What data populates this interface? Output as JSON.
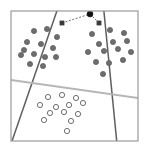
{
  "figure": {
    "title": "",
    "caption": "",
    "background_color": "#ffffff",
    "frame": {
      "name": "plot-frame",
      "x": 11,
      "y": 11,
      "width": 127,
      "height": 130,
      "stroke_color": "#9a9a9a",
      "stroke_width": 1.2
    }
  },
  "chart_data": {
    "type": "scatter",
    "title": "",
    "xlabel": "",
    "ylabel": "",
    "xlim": [
      11,
      138
    ],
    "ylim": [
      11,
      141
    ],
    "grid": false,
    "legend": null,
    "axes_visible": false,
    "series": [
      {
        "name": "class-a-upper-left",
        "marker": "filled-circle",
        "color": "#5a5a5a",
        "fill": "#6e6e6e",
        "radius": 2.6,
        "count": 13,
        "points": [
          [
            34,
            31
          ],
          [
            47,
            29
          ],
          [
            57,
            37
          ],
          [
            27,
            42
          ],
          [
            41,
            44
          ],
          [
            53,
            48
          ],
          [
            21,
            55
          ],
          [
            34,
            54
          ],
          [
            45,
            57
          ],
          [
            30,
            64
          ],
          [
            43,
            66
          ],
          [
            56,
            57
          ],
          [
            24,
            50
          ]
        ]
      },
      {
        "name": "class-a-upper-right",
        "marker": "filled-circle",
        "color": "#5a5a5a",
        "fill": "#6e6e6e",
        "radius": 2.6,
        "count": 14,
        "points": [
          [
            92,
            34
          ],
          [
            110,
            30
          ],
          [
            124,
            33
          ],
          [
            99,
            44
          ],
          [
            113,
            42
          ],
          [
            127,
            41
          ],
          [
            88,
            52
          ],
          [
            104,
            51
          ],
          [
            118,
            49
          ],
          [
            96,
            62
          ],
          [
            109,
            63
          ],
          [
            123,
            60
          ],
          [
            131,
            52
          ],
          [
            103,
            74
          ]
        ]
      },
      {
        "name": "class-b-lower",
        "marker": "hollow-circle",
        "color": "#6e6e6e",
        "fill": "none",
        "radius": 2.6,
        "count": 13,
        "points": [
          [
            48,
            97
          ],
          [
            62,
            95
          ],
          [
            76,
            98
          ],
          [
            40,
            105
          ],
          [
            56,
            107
          ],
          [
            69,
            105
          ],
          [
            83,
            103
          ],
          [
            50,
            113
          ],
          [
            64,
            112
          ],
          [
            78,
            114
          ],
          [
            44,
            120
          ],
          [
            71,
            121
          ],
          [
            67,
            131
          ]
        ]
      }
    ],
    "decision_lines": [
      {
        "name": "decision-boundary-1",
        "style": "solid",
        "color": "#5d5d65",
        "width": 1.5,
        "x1": 60,
        "y1": 2,
        "x2": 12,
        "y2": 141
      },
      {
        "name": "decision-boundary-2",
        "style": "solid",
        "color": "#5d5d65",
        "width": 1.5,
        "x1": 103,
        "y1": 2,
        "x2": 117,
        "y2": 144
      },
      {
        "name": "decision-boundary-3",
        "style": "solid",
        "color": "#b6b6b6",
        "width": 1.8,
        "x1": 11,
        "y1": 80,
        "x2": 138,
        "y2": 98
      }
    ],
    "support_markers": [
      {
        "name": "support-vector-left",
        "marker": "filled-square",
        "color": "#3a3a3a",
        "size": 4.2,
        "x": 62,
        "y": 23
      },
      {
        "name": "support-vector-right",
        "marker": "filled-square",
        "color": "#3a3a3a",
        "size": 4.2,
        "x": 99,
        "y": 23
      },
      {
        "name": "query-point",
        "marker": "filled-circle",
        "color": "#111111",
        "radius": 3.0,
        "x": 90,
        "y": 14
      }
    ],
    "connector_lines": [
      {
        "name": "margin-connector-left",
        "style": "dashed",
        "color": "#4a4a4a",
        "width": 0.8,
        "dash": "2,1.6",
        "x1": 62,
        "y1": 23,
        "x2": 90,
        "y2": 14
      },
      {
        "name": "margin-connector-right",
        "style": "dashed",
        "color": "#4a4a4a",
        "width": 0.8,
        "dash": "2,1.6",
        "x1": 90,
        "y1": 14,
        "x2": 99,
        "y2": 23
      }
    ]
  }
}
